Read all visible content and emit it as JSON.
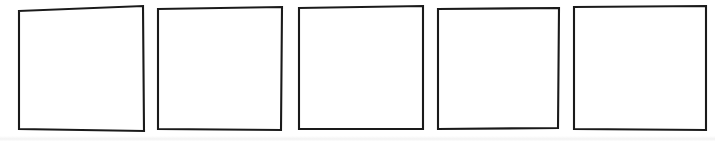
{
  "figure": {
    "title": "",
    "background_color": "#ffffff",
    "stroke_color": "#1a1a1a",
    "fill_color": "#ffffff",
    "stroke_width": 2.1,
    "count": 5,
    "canvas": {
      "width": 715,
      "height": 141
    }
  },
  "shapes": [
    {
      "name": "square-1",
      "label": "",
      "index": 1,
      "points": "19,11 143,6 144,131 19,129 19,11",
      "bbox": {
        "x": 19,
        "y": 6,
        "width": 125,
        "height": 125
      }
    },
    {
      "name": "square-2",
      "label": "",
      "index": 2,
      "points": "158,9 282,7 281,130 158,129 158,9",
      "bbox": {
        "x": 158,
        "y": 7,
        "width": 124,
        "height": 123
      }
    },
    {
      "name": "square-3",
      "label": "",
      "index": 3,
      "points": "299,8 423,6 423,129 299,129 299,8",
      "bbox": {
        "x": 299,
        "y": 6,
        "width": 124,
        "height": 123
      }
    },
    {
      "name": "square-4",
      "label": "",
      "index": 4,
      "points": "438,9 559,8 558,128 438,129 438,9",
      "bbox": {
        "x": 438,
        "y": 8,
        "width": 121,
        "height": 121
      }
    },
    {
      "name": "square-5",
      "label": "",
      "index": 5,
      "points": "574,7 706,6 706,130 574,129 574,7",
      "bbox": {
        "x": 574,
        "y": 6,
        "width": 132,
        "height": 124
      }
    }
  ]
}
